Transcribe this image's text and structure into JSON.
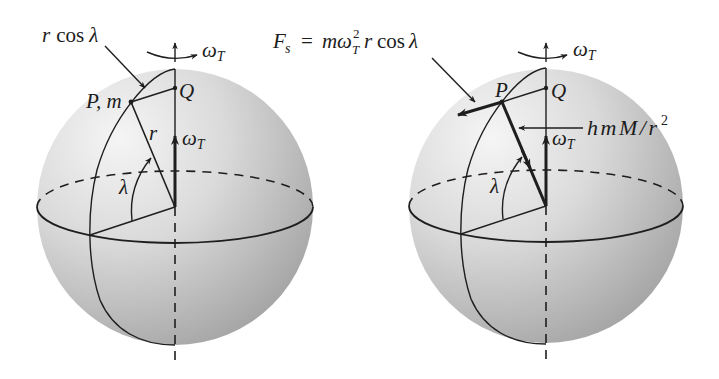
{
  "colors": {
    "line": "#1e1e1e",
    "sphere_light": "#f3f3f3",
    "sphere_mid": "#cfcfcf",
    "sphere_dark": "#a6a6a6",
    "background": "#ffffff"
  },
  "left_panel": {
    "rcos_label": {
      "r": "r",
      "cos": "cos",
      "lambda": "λ"
    },
    "omega_top": {
      "symbol": "ω",
      "sub": "T"
    },
    "point_p_label": "P, m",
    "point_q_label": "Q",
    "radius_label": "r",
    "omega_axis": {
      "symbol": "ω",
      "sub": "T"
    },
    "latitude_label": "λ"
  },
  "right_panel": {
    "centrifugal_label": {
      "F": "F",
      "s": "s",
      "equals": "=",
      "m": "m",
      "omega": "ω",
      "sup": "2",
      "sub": "T",
      "r": "r",
      "cos": "cos",
      "lambda": "λ"
    },
    "omega_top": {
      "symbol": "ω",
      "sub": "T"
    },
    "point_p_label": "P",
    "point_q_label": "Q",
    "gravity_label": {
      "text": "hmM/r",
      "sup": "2"
    },
    "omega_axis": {
      "symbol": "ω",
      "sub": "T"
    },
    "latitude_label": "λ"
  }
}
